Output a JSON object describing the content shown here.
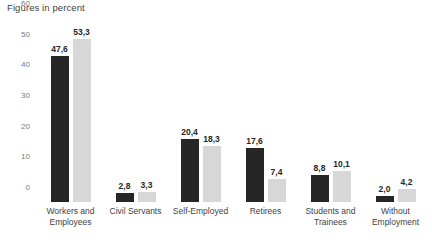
{
  "chart_data": {
    "type": "bar",
    "title": "Figures in percent",
    "xlabel": "",
    "ylabel": "",
    "ylim": [
      0,
      60
    ],
    "yticks": [
      "0",
      "10",
      "20",
      "30",
      "40",
      "50",
      "60"
    ],
    "grid": false,
    "legend": "none",
    "categories": [
      "Workers and Employees",
      "Civil Servants",
      "Self-Employed",
      "Retirees",
      "Students and Trainees",
      "Without Employment"
    ],
    "series": [
      {
        "name": "series-a",
        "color": "#262626",
        "values": [
          47.6,
          2.8,
          20.4,
          17.6,
          8.8,
          2.0
        ],
        "labels": [
          "47,6",
          "2,8",
          "20,4",
          "17,6",
          "8,8",
          "2,0"
        ]
      },
      {
        "name": "series-b",
        "color": "#d7d7d7",
        "values": [
          53.3,
          3.3,
          18.3,
          7.4,
          10.1,
          4.2
        ],
        "labels": [
          "53,3",
          "3,3",
          "18,3",
          "7,4",
          "10,1",
          "4,2"
        ]
      }
    ]
  },
  "categories_display": [
    {
      "line1": "Workers and",
      "line2": "Employees"
    },
    {
      "line1": "Civil Servants",
      "line2": ""
    },
    {
      "line1": "Self-Employed",
      "line2": ""
    },
    {
      "line1": "Retirees",
      "line2": ""
    },
    {
      "line1": "Students and",
      "line2": "Trainees"
    },
    {
      "line1": "Without",
      "line2": "Employment"
    }
  ]
}
